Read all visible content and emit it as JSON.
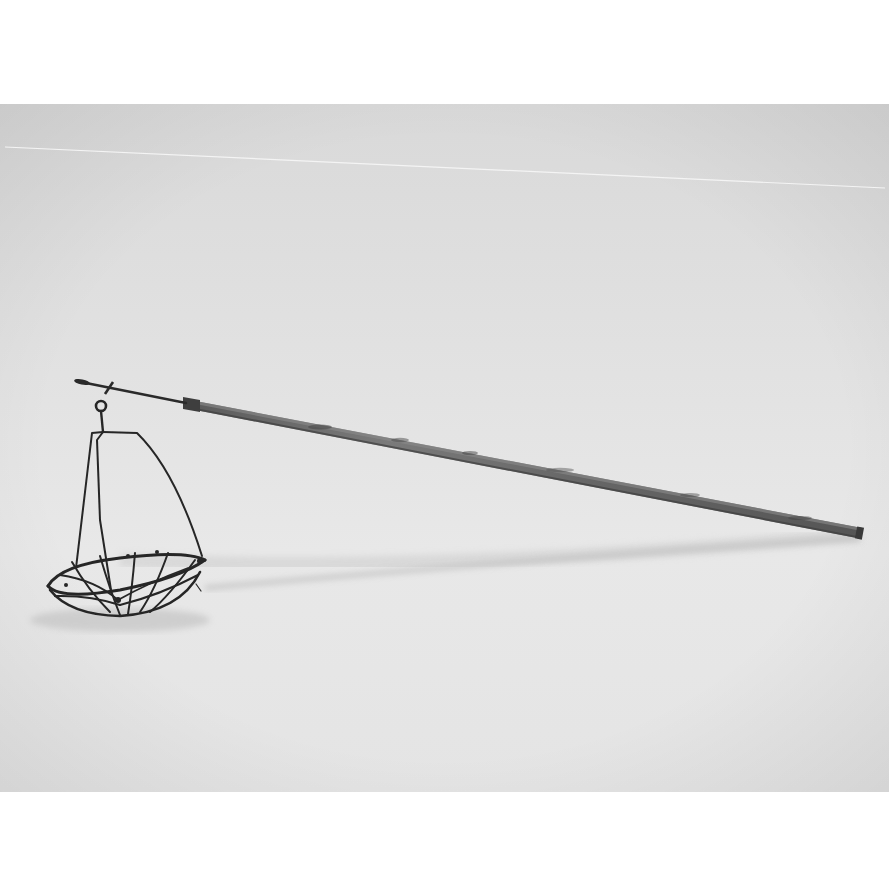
{
  "page": {
    "background": "#ffffff"
  },
  "photo": {
    "subject": "wire basket hanging from wooden pole",
    "tone": "greyscale",
    "colors": {
      "backdrop_top": "#dcdcdc",
      "backdrop_mid": "#e6e6e6",
      "backdrop_bottom": "#e9e9e9",
      "wire": "#2b2b2b",
      "pole": "#6e6e6e",
      "pole_dark": "#4a4a4a",
      "shadow": "#bdbdbd"
    }
  }
}
